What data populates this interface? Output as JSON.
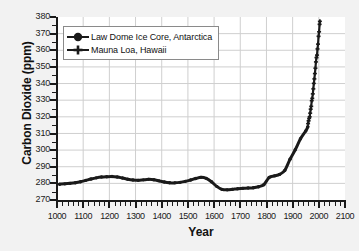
{
  "chart_data": {
    "type": "line",
    "title": "",
    "xlabel": "Year",
    "ylabel": "Carbon Dioxide (ppm)",
    "xlim": [
      1000,
      2100
    ],
    "ylim": [
      270,
      380
    ],
    "xticks": [
      1000,
      1100,
      1200,
      1300,
      1400,
      1500,
      1600,
      1700,
      1800,
      1900,
      2000,
      2100
    ],
    "yticks": [
      270,
      280,
      290,
      300,
      310,
      320,
      330,
      340,
      350,
      360,
      370,
      380
    ],
    "xtick_labels": [
      "1000",
      "1100",
      "1200",
      "1300",
      "1400",
      "1500",
      "1600",
      "1700",
      "1800",
      "1900",
      "2000",
      "2100"
    ],
    "ytick_labels": [
      "270",
      "280",
      "290",
      "300",
      "310",
      "320",
      "330",
      "340",
      "350",
      "360",
      "370",
      "380"
    ],
    "x_minor_step": 20,
    "y_minor_step": 5,
    "grid": true,
    "grid_color": "#cfcfcf",
    "legend_position": "upper-left",
    "series": [
      {
        "name": "Law Dome Ice Core, Antarctica",
        "marker": "filled-circle",
        "color": "#1a1a1a",
        "x": [
          1010,
          1030,
          1050,
          1070,
          1090,
          1110,
          1130,
          1150,
          1170,
          1190,
          1210,
          1230,
          1250,
          1270,
          1290,
          1310,
          1330,
          1350,
          1370,
          1390,
          1410,
          1430,
          1450,
          1470,
          1490,
          1510,
          1530,
          1550,
          1570,
          1590,
          1610,
          1630,
          1650,
          1670,
          1690,
          1710,
          1730,
          1750,
          1770,
          1790,
          1810,
          1830,
          1850,
          1870,
          1890,
          1910,
          1930,
          1950,
          1958
        ],
        "values": [
          279.5,
          279.7,
          280.0,
          280.4,
          281.0,
          281.8,
          282.6,
          283.3,
          283.8,
          284.0,
          284.1,
          283.8,
          283.2,
          282.5,
          282.0,
          281.8,
          282.1,
          282.4,
          282.2,
          281.5,
          280.8,
          280.4,
          280.3,
          280.6,
          281.2,
          282.0,
          282.9,
          283.6,
          283.0,
          281.0,
          278.2,
          276.4,
          276.1,
          276.4,
          276.8,
          277.0,
          277.2,
          277.4,
          278.0,
          279.2,
          283.5,
          284.5,
          285.4,
          287.8,
          294.5,
          300.2,
          306.8,
          311.5,
          314.0
        ]
      },
      {
        "name": "Mauna Loa, Hawaii",
        "marker": "plus",
        "color": "#1a1a1a",
        "x": [
          1959,
          1961,
          1963,
          1965,
          1967,
          1969,
          1971,
          1973,
          1975,
          1977,
          1979,
          1981,
          1983,
          1985,
          1987,
          1989,
          1991,
          1993,
          1995,
          1997,
          1999,
          2001,
          2003,
          2004
        ],
        "values": [
          315.9,
          317.6,
          319.0,
          320.0,
          322.2,
          324.6,
          326.3,
          329.7,
          331.1,
          333.8,
          336.8,
          340.1,
          342.8,
          346.0,
          349.2,
          353.0,
          355.6,
          357.1,
          360.8,
          363.7,
          368.4,
          371.1,
          375.6,
          377.4
        ]
      }
    ]
  },
  "legend": {
    "entries": [
      {
        "label": "Law Dome Ice Core, Antarctica",
        "marker": "filled-circle"
      },
      {
        "label": "Mauna Loa, Hawaii",
        "marker": "plus"
      }
    ]
  },
  "axes": {
    "y_title": "Carbon Dioxide (ppm)",
    "x_title": "Year"
  }
}
